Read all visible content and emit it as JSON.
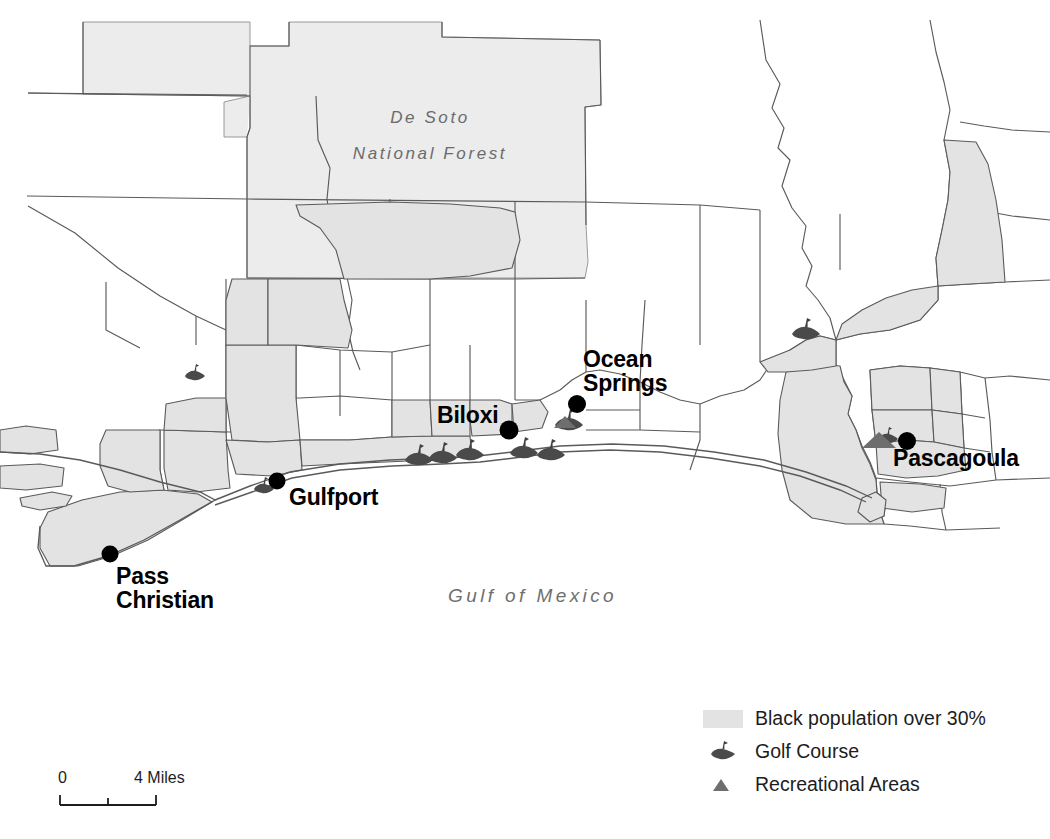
{
  "map": {
    "title": "Mississippi Gulf Coast Black Population and Recreation Map",
    "background_color": "#ffffff",
    "polygon_fill": "#e3e3e3",
    "polygon_stroke": "#5a5a5a",
    "forest_fill": "#ececec",
    "golf_symbol_color": "#4a4a4a",
    "rec_symbol_color": "#6e6e6e",
    "city_dot_color": "#000000",
    "labels": {
      "forest": "De Soto\nNational Forest",
      "water": "Gulf of Mexico"
    },
    "cities": [
      {
        "name": "Pass Christian",
        "label": "Pass\nChristian"
      },
      {
        "name": "Gulfport",
        "label": "Gulfport"
      },
      {
        "name": "Biloxi",
        "label": "Biloxi"
      },
      {
        "name": "Ocean Springs",
        "label": "Ocean\nSprings"
      },
      {
        "name": "Pascagoula",
        "label": "Pascagoula"
      }
    ]
  },
  "legend": {
    "items": [
      {
        "symbol": "polygon-swatch",
        "label": "Black population over 30%"
      },
      {
        "symbol": "golf-course-icon",
        "label": "Golf Course"
      },
      {
        "symbol": "recreational-area-icon",
        "label": "Recreational Areas"
      }
    ]
  },
  "scalebar": {
    "min_label": "0",
    "max_label": "4 Miles",
    "units": "Miles",
    "max_value": 4,
    "tick_count": 3
  }
}
